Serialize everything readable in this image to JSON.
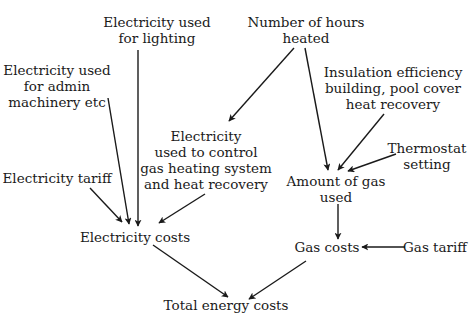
{
  "diagram": {
    "title": "",
    "nodes": {
      "elec_lighting": {
        "lines": [
          "Electricity used",
          "for lighting"
        ]
      },
      "elec_admin": {
        "lines": [
          "Electricity used",
          "for admin",
          "machinery etc"
        ]
      },
      "hours_heated": {
        "lines": [
          "Number of hours",
          "heated"
        ]
      },
      "insulation": {
        "lines": [
          "Insulation efficiency",
          "building, pool cover",
          "heat recovery"
        ]
      },
      "thermostat": {
        "lines": [
          "Thermostat",
          "setting"
        ]
      },
      "elec_control": {
        "lines": [
          "Electricity",
          "used to control",
          "gas heating system",
          "and heat recovery"
        ]
      },
      "gas_amount": {
        "lines": [
          "Amount of gas",
          "used"
        ]
      },
      "elec_tariff": {
        "lines": [
          "Electricity tariff"
        ]
      },
      "elec_costs": {
        "lines": [
          "Electricity costs"
        ]
      },
      "gas_costs": {
        "lines": [
          "Gas costs"
        ]
      },
      "gas_tariff": {
        "lines": [
          "Gas tariff"
        ]
      },
      "total_costs": {
        "lines": [
          "Total energy costs"
        ]
      }
    },
    "edges": [
      {
        "from": "Electricity used for lighting",
        "to": "Electricity costs"
      },
      {
        "from": "Electricity used for admin machinery etc",
        "to": "Electricity costs"
      },
      {
        "from": "Electricity tariff",
        "to": "Electricity costs"
      },
      {
        "from": "Electricity used to control gas heating system and heat recovery",
        "to": "Electricity costs"
      },
      {
        "from": "Number of hours heated",
        "to": "Electricity used to control gas heating system and heat recovery"
      },
      {
        "from": "Number of hours heated",
        "to": "Amount of gas used"
      },
      {
        "from": "Insulation efficiency building, pool cover heat recovery",
        "to": "Amount of gas used"
      },
      {
        "from": "Thermostat setting",
        "to": "Amount of gas used"
      },
      {
        "from": "Amount of gas used",
        "to": "Gas costs"
      },
      {
        "from": "Gas tariff",
        "to": "Gas costs"
      },
      {
        "from": "Electricity costs",
        "to": "Total energy costs"
      },
      {
        "from": "Gas costs",
        "to": "Total energy costs"
      }
    ],
    "colors": {
      "ink": "#1a1a1a",
      "background": "#ffffff"
    }
  }
}
